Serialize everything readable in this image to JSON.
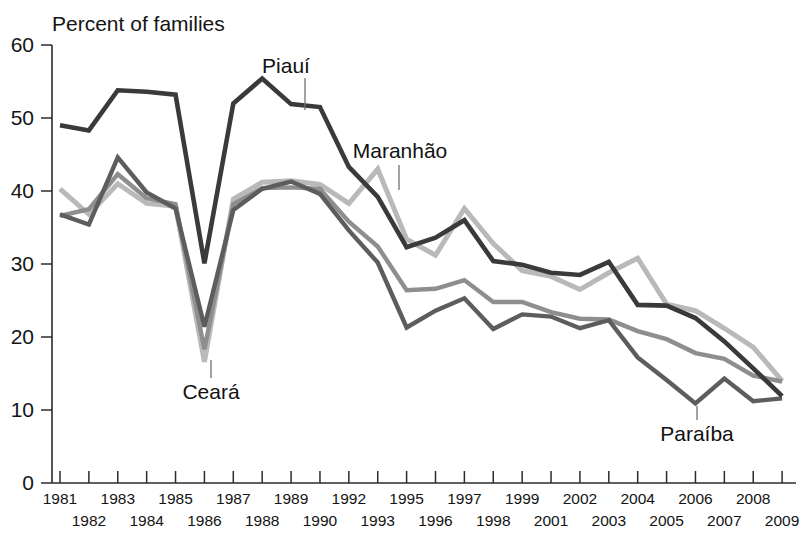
{
  "chart_data": {
    "type": "line",
    "title": "",
    "xlabel": "",
    "ylabel": "Percent of families",
    "ylim": [
      0,
      60
    ],
    "yticks": [
      0,
      10,
      20,
      30,
      40,
      50,
      60
    ],
    "grid": false,
    "legend": "inline-annotations",
    "x": [
      "1981",
      "1982",
      "1983",
      "1984",
      "1985",
      "1986",
      "1987",
      "1988",
      "1989",
      "1990",
      "1992",
      "1993",
      "1995",
      "1996",
      "1997",
      "1998",
      "1999",
      "2001",
      "2002",
      "2003",
      "2004",
      "2005",
      "2006",
      "2007",
      "2008",
      "2009"
    ],
    "series": [
      {
        "name": "Piauí",
        "color": "#3a3a3a",
        "width": 4.6,
        "values": [
          49.0,
          48.3,
          53.8,
          53.6,
          53.2,
          30.1,
          52.0,
          55.4,
          51.9,
          51.5,
          43.3,
          39.2,
          32.3,
          33.6,
          36.0,
          30.4,
          29.9,
          28.8,
          28.5,
          30.3,
          24.4,
          24.3,
          22.6,
          19.4,
          15.7,
          11.9
        ]
      },
      {
        "name": "Maranhão",
        "color": "#b9b9b9",
        "width": 5.0,
        "values": [
          40.3,
          36.8,
          41.0,
          38.3,
          37.9,
          16.6,
          38.9,
          41.2,
          41.4,
          40.9,
          38.3,
          43.0,
          33.4,
          31.2,
          37.6,
          32.8,
          29.1,
          28.3,
          26.5,
          28.8,
          30.8,
          24.5,
          23.6,
          21.2,
          18.6,
          14.0
        ]
      },
      {
        "name": "Ceará",
        "color": "#8e8e8e",
        "width": 4.4,
        "values": [
          36.6,
          37.5,
          42.3,
          39.0,
          38.2,
          18.3,
          38.2,
          40.4,
          40.5,
          40.3,
          35.8,
          32.4,
          26.4,
          26.6,
          27.8,
          24.8,
          24.8,
          23.4,
          22.5,
          22.4,
          20.8,
          19.7,
          17.8,
          17.0,
          14.7,
          13.9
        ]
      },
      {
        "name": "Paraíba",
        "color": "#5d5d5d",
        "width": 4.4,
        "values": [
          36.8,
          35.4,
          44.6,
          39.8,
          37.6,
          21.4,
          37.4,
          40.3,
          41.3,
          39.6,
          34.6,
          30.2,
          21.3,
          23.6,
          25.3,
          21.1,
          23.1,
          22.8,
          21.2,
          22.3,
          17.2,
          14.1,
          10.9,
          14.3,
          11.2,
          11.6
        ]
      }
    ],
    "annotations": [
      {
        "label": "Piauí",
        "x": 1.5,
        "y": 2.5
      },
      {
        "label": "Maranhão",
        "x": 1.5,
        "y": 2.5
      },
      {
        "label": "Ceará",
        "x": 1.5,
        "y": 2.5
      },
      {
        "label": "Paraíba",
        "x": 1.5,
        "y": 2.5
      }
    ]
  },
  "axes": {
    "y_title": "Percent of families",
    "y_ticks": [
      "0",
      "10",
      "20",
      "30",
      "40",
      "50",
      "60"
    ],
    "x_ticks_row1": [
      "1981",
      "",
      "1983",
      "",
      "1985",
      "",
      "1987",
      "",
      "1989",
      "",
      "1992",
      "",
      "1995",
      "",
      "1997",
      "",
      "1999",
      "",
      "2002",
      "",
      "2004",
      "",
      "2006",
      "",
      "2008",
      ""
    ],
    "x_ticks_row2": [
      "",
      "1982",
      "",
      "1984",
      "",
      "1986",
      "",
      "1988",
      "",
      "1990",
      "",
      "1993",
      "",
      "1996",
      "",
      "1998",
      "",
      "2001",
      "",
      "2003",
      "",
      "2005",
      "",
      "2007",
      "",
      "2009"
    ]
  },
  "labels": {
    "piaui": "Piauí",
    "maranhao": "Maranhão",
    "ceara": "Ceará",
    "paraiba": "Paraíba"
  }
}
